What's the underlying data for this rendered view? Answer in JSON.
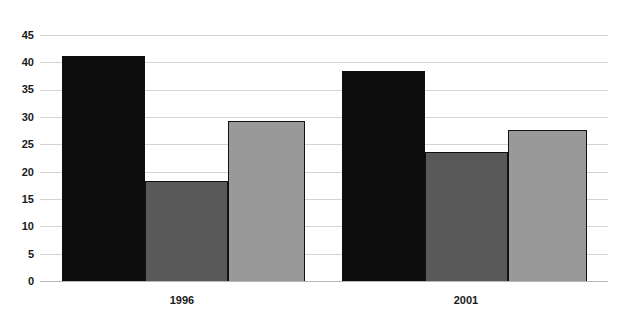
{
  "chart_data": {
    "type": "bar",
    "title": "",
    "subtitle": "",
    "xlabel": "",
    "ylabel": "",
    "categories": [
      "1996",
      "2001"
    ],
    "series": [
      {
        "name": "series-1",
        "color": "#0d0d0d",
        "values": [
          41.2,
          38.4
        ]
      },
      {
        "name": "series-2",
        "color": "#595959",
        "values": [
          18.3,
          23.6
        ]
      },
      {
        "name": "series-3",
        "color": "#999999",
        "values": [
          29.3,
          27.6
        ]
      }
    ],
    "ylim": [
      0,
      45
    ],
    "ytick_values": [
      0,
      5,
      10,
      15,
      20,
      25,
      30,
      35,
      40,
      45
    ],
    "ytick_labels": [
      "0",
      "5",
      "10",
      "15",
      "20",
      "25",
      "30",
      "35",
      "40",
      "45"
    ],
    "grid": true,
    "grid_axis": "y",
    "legend": "none",
    "legend_position": "none",
    "annotations": []
  },
  "axis": {
    "y_labels": [
      "45",
      "40",
      "35",
      "30",
      "25",
      "20",
      "15",
      "10",
      "5",
      "0"
    ],
    "x_labels": [
      "1996",
      "2001"
    ]
  },
  "colors": {
    "background": "#ffffff",
    "gridline": "#d4d4d4",
    "baseline": "#b8b8b8",
    "text": "#1a1a1a",
    "bar_dark": "#0d0d0d",
    "bar_mid": "#595959",
    "bar_light": "#999999"
  }
}
